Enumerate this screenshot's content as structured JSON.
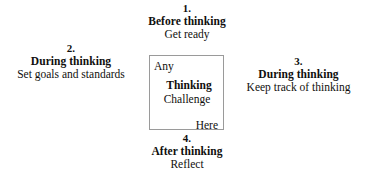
{
  "diagram": {
    "center_box": {
      "line_top_left": "Any",
      "line_emphasis": "Thinking",
      "line_middle": "Challenge",
      "line_bottom_right": "Here",
      "border_color": "#9a9a9a"
    },
    "phases": [
      {
        "id": "before",
        "number": "1.",
        "title": "Before thinking",
        "detail": "Get ready"
      },
      {
        "id": "during-goals",
        "number": "2.",
        "title": "During thinking",
        "detail": "Set goals and standards"
      },
      {
        "id": "during-track",
        "number": "3.",
        "title": "During thinking",
        "detail": "Keep track of thinking"
      },
      {
        "id": "after",
        "number": "4.",
        "title": "After thinking",
        "detail": "Reflect"
      }
    ],
    "text_color": "#100f0d",
    "background_color": "#ffffff"
  }
}
